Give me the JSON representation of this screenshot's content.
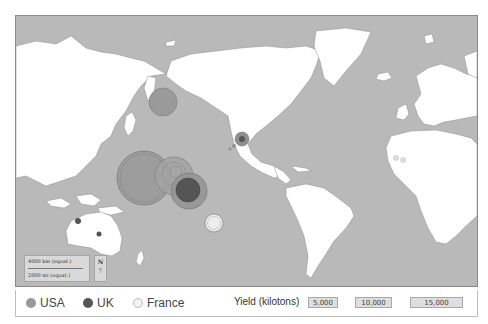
{
  "map": {
    "ocean_color": "#b9b9b9",
    "land_color": "#ffffff",
    "markers": [
      {
        "country": "USA",
        "location": "Aleutian Islands (Amchitka)",
        "cx": 147,
        "cy": 86,
        "r": 14,
        "color": "#9a9a9a"
      },
      {
        "country": "USA",
        "location": "Nevada Test Site",
        "cx": 226,
        "cy": 123,
        "r": 7,
        "color": "#8f8f8f",
        "inner_r": 3,
        "inner_color": "#555555"
      },
      {
        "country": "USA",
        "location": "Marshall Islands (Bikini/Enewetak)",
        "cx": 128,
        "cy": 162,
        "r": 27,
        "color": "#9a9a9a"
      },
      {
        "country": "USA",
        "location": "Johnston Atoll",
        "cx": 158,
        "cy": 160,
        "r": 19,
        "color": "#a3a3a3"
      },
      {
        "country": "USA",
        "location": "Christmas Island (US tests)",
        "cx": 173,
        "cy": 175,
        "r": 18,
        "color": "#959595"
      },
      {
        "country": "UK",
        "location": "Christmas/Malden Island",
        "cx": 172,
        "cy": 174,
        "r": 12,
        "color": "#555555"
      },
      {
        "country": "UK",
        "location": "Monte Bello Islands",
        "cx": 62,
        "cy": 205,
        "r": 3,
        "color": "#555555"
      },
      {
        "country": "UK",
        "location": "Maralinga / Emu Field",
        "cx": 83,
        "cy": 218,
        "r": 2.5,
        "color": "#555555"
      },
      {
        "country": "France",
        "location": "Mururoa / Fangataufa",
        "cx": 198,
        "cy": 207,
        "r": 9,
        "color": "#eeeeee"
      },
      {
        "country": "France",
        "location": "Reggane (Algeria)",
        "cx": 380,
        "cy": 142,
        "r": 2.5,
        "color": "#dddddd"
      },
      {
        "country": "France",
        "location": "In Ekker (Algeria)",
        "cx": 387,
        "cy": 144,
        "r": 2.5,
        "color": "#dddddd"
      }
    ]
  },
  "scale": {
    "km_label": "4000 km (equat.)",
    "mi_label": "2000 mi (equat.)",
    "north_label": "N",
    "north_arrow": "↑"
  },
  "legend": {
    "series": [
      {
        "label": "USA",
        "color": "#999999"
      },
      {
        "label": "UK",
        "color": "#555555"
      },
      {
        "label": "France",
        "color": "#f2f2f2"
      }
    ],
    "yield_title": "Yield (kilotons)",
    "yield_buttons": [
      "5,000",
      "10,000",
      "15,000"
    ]
  }
}
